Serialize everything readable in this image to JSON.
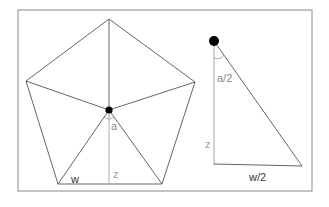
{
  "diagram": {
    "type": "geometry",
    "left_figure": {
      "shape": "regular pentagon divided into 5 triangles from center",
      "labels": {
        "angle": "a",
        "height": "z",
        "base": "w"
      }
    },
    "right_figure": {
      "shape": "right triangle",
      "labels": {
        "angle": "a/2",
        "height": "z",
        "base": "w/2"
      }
    },
    "colors": {
      "line": "#555555",
      "gray_line": "#9a9a9a",
      "gray_text": "#8a8a8a",
      "dark_text": "#333333",
      "dot": "#000000",
      "frame": "#888888"
    }
  }
}
